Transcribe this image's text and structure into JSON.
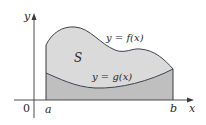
{
  "figure": {
    "colors": {
      "region_upper_fill": "#dadada",
      "region_lower_fill": "#bfbfbf",
      "curve_stroke": "#3b4450",
      "axis_stroke": "#3a3a3a",
      "boundary_stroke": "#3a3a3a"
    },
    "labels": {
      "y_axis": "y",
      "x_axis": "x",
      "origin": "0",
      "a": "a",
      "b": "b",
      "region": "S",
      "f_curve": "y = f(x)",
      "g_curve": "y = g(x)"
    }
  }
}
